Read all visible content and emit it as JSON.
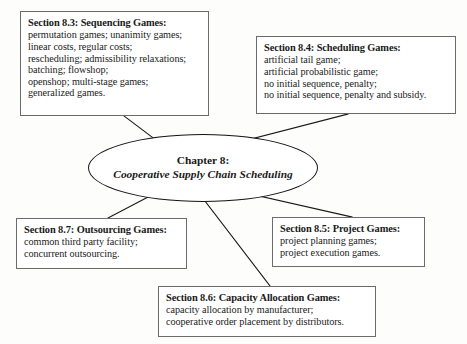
{
  "diagram": {
    "type": "hub-and-spoke-concept-map",
    "center": {
      "line1": "Chapter 8:",
      "line2": "Cooperative Supply Chain Scheduling"
    },
    "colors": {
      "box_border": "#6b6b6b",
      "ellipse_border": "#15151a",
      "connector": "#1a1a1a",
      "background": "#fdfdfc",
      "text": "#1a1a1a"
    },
    "nodes": [
      {
        "id": "section-8-3",
        "title": "Section 8.3: Sequencing Games:",
        "lines": [
          "permutation games; unanimity games;",
          "linear costs, regular costs;",
          "rescheduling; admissibility relaxations;",
          "batching; flowshop;",
          "openshop; multi-stage games;",
          "generalized games."
        ]
      },
      {
        "id": "section-8-4",
        "title": "Section 8.4: Scheduling Games:",
        "lines": [
          "artificial tail game;",
          "artificial probabilistic game;",
          "no initial sequence, penalty;",
          "no initial sequence, penalty and subsidy."
        ]
      },
      {
        "id": "section-8-7",
        "title": "Section 8.7: Outsourcing Games:",
        "lines": [
          "common third party facility;",
          "concurrent outsourcing."
        ]
      },
      {
        "id": "section-8-5",
        "title": "Section 8.5: Project Games:",
        "lines": [
          "project planning games;",
          "project execution games."
        ]
      },
      {
        "id": "section-8-6",
        "title": "Section 8.6: Capacity Allocation Games:",
        "lines": [
          "capacity allocation by manufacturer;",
          "cooperative order placement by distributors."
        ]
      }
    ]
  }
}
